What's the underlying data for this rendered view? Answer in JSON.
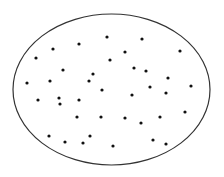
{
  "figure": {
    "width": 224,
    "height": 177,
    "background": "#ffffff",
    "ellipse": {
      "cx": 111.5,
      "cy": 89.5,
      "rx": 98.5,
      "ry": 75.5,
      "stroke": "#333333",
      "stroke_width": 1.2
    },
    "dot_color": "#111111",
    "dot_radius": 1.6,
    "dots": [
      [
        107,
        37
      ],
      [
        79,
        44
      ],
      [
        53,
        49
      ],
      [
        36,
        58
      ],
      [
        110,
        60
      ],
      [
        63,
        70
      ],
      [
        93,
        74
      ],
      [
        27,
        83
      ],
      [
        50,
        81
      ],
      [
        89,
        81
      ],
      [
        142,
        39
      ],
      [
        125,
        52
      ],
      [
        180,
        51
      ],
      [
        134,
        68
      ],
      [
        146,
        71
      ],
      [
        168,
        78
      ],
      [
        150,
        87
      ],
      [
        191,
        86
      ],
      [
        102,
        90
      ],
      [
        38,
        100
      ],
      [
        59,
        98
      ],
      [
        60,
        104
      ],
      [
        79,
        100
      ],
      [
        77,
        117
      ],
      [
        101,
        117
      ],
      [
        49,
        136
      ],
      [
        65,
        142
      ],
      [
        83,
        143
      ],
      [
        90,
        136
      ],
      [
        132,
        95
      ],
      [
        166,
        93
      ],
      [
        125,
        118
      ],
      [
        141,
        123
      ],
      [
        160,
        117
      ],
      [
        185,
        112
      ],
      [
        153,
        140
      ],
      [
        166,
        144
      ],
      [
        113,
        146
      ]
    ]
  }
}
